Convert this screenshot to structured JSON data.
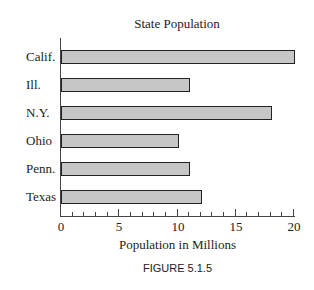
{
  "chart_data": {
    "type": "bar",
    "orientation": "horizontal",
    "title": "State Population",
    "xlabel": "Population in Millions",
    "ylabel": "",
    "categories": [
      "Calif.",
      "Ill.",
      "N.Y.",
      "Ohio",
      "Penn.",
      "Texas"
    ],
    "values": [
      20,
      11,
      18,
      10,
      11,
      12
    ],
    "xlim": [
      0,
      20
    ],
    "xticks": [
      0,
      5,
      10,
      15,
      20
    ],
    "minor_tick_step": 1,
    "grid": false,
    "bar_color": "#c6c6c6",
    "edge_color": "#222222"
  },
  "caption": "FIGURE 5.1.5"
}
